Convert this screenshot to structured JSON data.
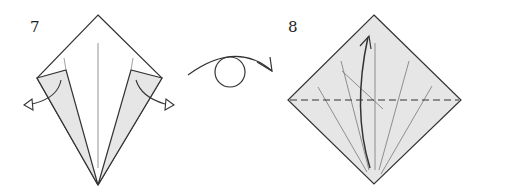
{
  "diagram": {
    "type": "origami-instructions",
    "steps": [
      {
        "number": "7",
        "description": "Kite base with side flaps unfolded outward",
        "arrows": [
          "unfold-left-flap",
          "unfold-right-flap"
        ]
      },
      {
        "number": "8",
        "description": "Square with horizontal valley fold line, fold bottom point up to top",
        "fold_line": "dashed-horizontal",
        "arrows": [
          "fold-up"
        ]
      }
    ],
    "transition": {
      "symbol": "turn-over",
      "description": "Turn the model over"
    },
    "colors": {
      "paper_shaded": "#e6e6e6",
      "paper_white": "#ffffff",
      "line": "#333333",
      "crease": "#666666"
    }
  }
}
